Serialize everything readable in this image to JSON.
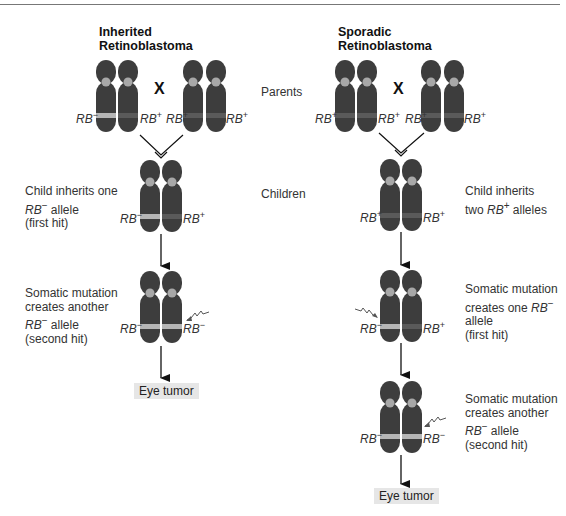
{
  "left_panel": {
    "title_line1": "Inherited",
    "title_line2": "Retinoblastoma",
    "cross_symbol": "X",
    "parents": [
      {
        "allele": "RB",
        "sign": "−"
      },
      {
        "allele": "RB",
        "sign": "+"
      },
      {
        "allele": "RB",
        "sign": "+"
      },
      {
        "allele": "RB",
        "sign": "+"
      }
    ],
    "child": [
      {
        "allele": "RB",
        "sign": "−"
      },
      {
        "allele": "RB",
        "sign": "+"
      }
    ],
    "child_note": {
      "line1": "Child inherits one",
      "line2_gene": "RB",
      "line2_sign": "−",
      "line2_rest": " allele",
      "line3": "(first hit)"
    },
    "second_hit": [
      {
        "allele": "RB",
        "sign": "−"
      },
      {
        "allele": "RB",
        "sign": "−"
      }
    ],
    "second_hit_note": {
      "line1": "Somatic mutation",
      "line2": "creates another",
      "line3_gene": "RB",
      "line3_sign": "−",
      "line3_rest": " allele",
      "line4": "(second hit)"
    },
    "outcome": "Eye tumor"
  },
  "center_labels": {
    "parents": "Parents",
    "children": "Children"
  },
  "right_panel": {
    "title_line1": "Sporadic",
    "title_line2": "Retinoblastoma",
    "cross_symbol": "X",
    "parents": [
      {
        "allele": "RB",
        "sign": "+"
      },
      {
        "allele": "RB",
        "sign": "+"
      },
      {
        "allele": "RB",
        "sign": "+"
      },
      {
        "allele": "RB",
        "sign": "+"
      }
    ],
    "child": [
      {
        "allele": "RB",
        "sign": "+"
      },
      {
        "allele": "RB",
        "sign": "+"
      }
    ],
    "child_note": {
      "line1": "Child inherits",
      "line2_pre": "two ",
      "line2_gene": "RB",
      "line2_sign": "+",
      "line2_rest": " alleles"
    },
    "first_hit": [
      {
        "allele": "RB",
        "sign": "−"
      },
      {
        "allele": "RB",
        "sign": "+"
      }
    ],
    "first_hit_note": {
      "line1": "Somatic mutation",
      "line2_pre": "creates one ",
      "line2_gene": "RB",
      "line2_sign": "−",
      "line3": "allele",
      "line4": "(first hit)"
    },
    "second_hit": [
      {
        "allele": "RB",
        "sign": "−"
      },
      {
        "allele": "RB",
        "sign": "−"
      }
    ],
    "second_hit_note": {
      "line1": "Somatic mutation",
      "line2": "creates another",
      "line3_gene": "RB",
      "line3_sign": "−",
      "line3_rest": " allele",
      "line4": "(second hit)"
    },
    "outcome": "Eye tumor"
  },
  "colors": {
    "chromosome": "#3d3d3d",
    "centromere": "#a8a8a8",
    "mutant_band": "#b5b5b5",
    "wildtype_band": "#5a5a5a",
    "tumor_box": "#e6e6e6",
    "arrow": "#111111"
  }
}
